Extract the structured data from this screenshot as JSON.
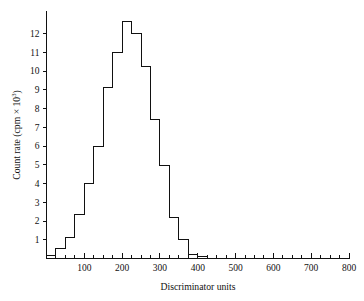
{
  "chart_data": {
    "type": "bar",
    "title": "",
    "subtitle": "",
    "xlabel": "Discriminator units",
    "ylabel": "Count rate (cpm × 10³)",
    "ylabel_parts": {
      "main": "Count rate (cpm × 10",
      "exponent": "3",
      "tail": ")"
    },
    "xlim": [
      0,
      800
    ],
    "ylim": [
      0,
      13.2
    ],
    "grid": false,
    "legend": null,
    "bin_width": 25,
    "x_major_ticks": [
      100,
      200,
      300,
      400,
      500,
      600,
      700,
      800
    ],
    "x_major_tick_labels": [
      "100",
      "200",
      "300",
      "400",
      "500",
      "600",
      "700",
      "800"
    ],
    "x_minor_tick_step": 25,
    "y_ticks": [
      1,
      2,
      3,
      4,
      5,
      6,
      7,
      8,
      9,
      10,
      11,
      12
    ],
    "y_tick_labels": [
      "1",
      "2",
      "3",
      "4",
      "5",
      "6",
      "7",
      "8",
      "9",
      "10",
      "11",
      "12"
    ],
    "bin_left_edges": [
      0,
      25,
      50,
      75,
      100,
      125,
      150,
      175,
      200,
      225,
      250,
      275,
      300,
      325,
      350,
      375,
      400
    ],
    "categories": [
      "0-25",
      "25-50",
      "50-75",
      "75-100",
      "100-125",
      "125-150",
      "150-175",
      "175-200",
      "200-225",
      "225-250",
      "250-275",
      "275-300",
      "300-325",
      "325-350",
      "350-375",
      "375-400",
      "400-425"
    ],
    "values": [
      0.15,
      0.55,
      1.1,
      2.35,
      4.0,
      6.0,
      9.1,
      11.0,
      12.65,
      12.0,
      10.25,
      7.4,
      4.95,
      2.2,
      1.0,
      0.2,
      0.1
    ]
  },
  "axes": {
    "x_axis_name": "discriminator-units-axis",
    "y_axis_name": "count-rate-axis"
  }
}
